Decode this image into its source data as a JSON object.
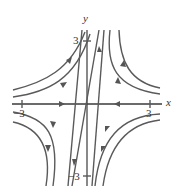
{
  "figure": {
    "type": "phase-portrait",
    "axes": {
      "x_label": "x",
      "y_label": "y",
      "x_ticks": [
        "−3",
        "3"
      ],
      "y_ticks": [
        "3",
        "−3"
      ]
    },
    "colors": {
      "curve": "#5a5a5a",
      "axis": "#3a3a3a",
      "background": "#ffffff"
    },
    "features": {
      "saddle_point": "origin",
      "incoming_axis": "x-axis (arrows toward origin)",
      "outgoing_line": "slanted line through origin (arrows away)"
    }
  }
}
